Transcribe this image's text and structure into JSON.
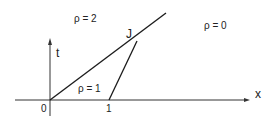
{
  "diagram": {
    "regions": [
      {
        "label": "ρ = 2"
      },
      {
        "label": "ρ = 0"
      },
      {
        "label": "ρ = 1"
      }
    ],
    "point_label": "J",
    "axes": {
      "t_label": "t",
      "x_label": "x",
      "origin_tick": "0",
      "one_tick": "1"
    },
    "line_color": "#1a1a1a",
    "axis_color": "#333333"
  }
}
